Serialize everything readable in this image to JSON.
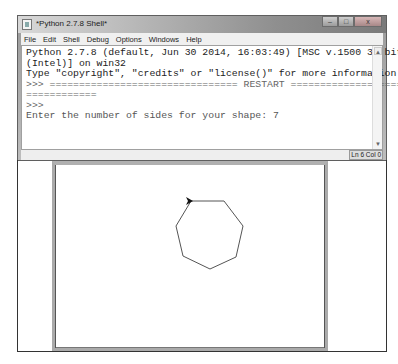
{
  "shell": {
    "title": "*Python 2.7.8 Shell*",
    "window_controls": {
      "minimize": "–",
      "maximize": "□",
      "close": "x"
    },
    "menu": [
      "File",
      "Edit",
      "Shell",
      "Debug",
      "Options",
      "Windows",
      "Help"
    ],
    "lines": [
      "Python 2.7.8 (default, Jun 30 2014, 16:03:49) [MSC v.1500 32 bit",
      "(Intel)] on win32",
      "Type \"copyright\", \"credits\" or \"license()\" for more information.",
      ">>> ================================ RESTART ====================",
      "============",
      ">>> ",
      "Enter the number of sides for your shape: 7"
    ],
    "status": "Ln 6 Col 0"
  },
  "turtle": {
    "sides": 7,
    "line_color": "#555555",
    "vertices": [
      [
        136,
        36
      ],
      [
        169,
        36
      ],
      [
        188,
        61
      ],
      [
        181,
        92
      ],
      [
        155,
        104
      ],
      [
        128,
        91
      ],
      [
        121,
        61
      ]
    ],
    "turtle_position": [
      136,
      36
    ]
  }
}
